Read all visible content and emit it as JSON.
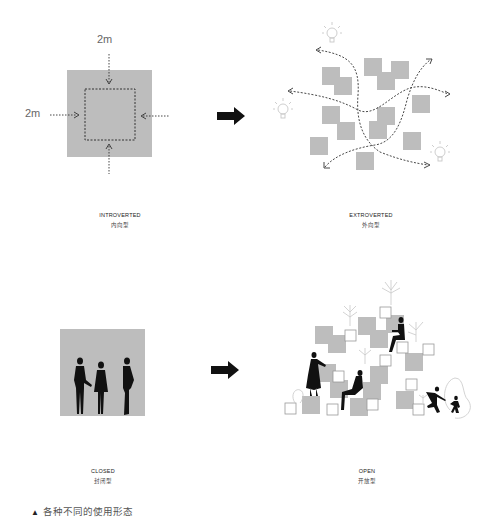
{
  "panels": [
    {
      "id": "introverted",
      "en": "INTROVERTED",
      "zh": "内向型",
      "dimension_labels": [
        "2m",
        "2m"
      ]
    },
    {
      "id": "extroverted",
      "en": "EXTROVERTED",
      "zh": "外向型"
    },
    {
      "id": "closed",
      "en": "CLOSED",
      "zh": "封闭型"
    },
    {
      "id": "open",
      "en": "OPEN",
      "zh": "开放型"
    }
  ],
  "caption": {
    "marker": "▲",
    "text": "各种不同的使用形态"
  },
  "colors": {
    "block_gray": "#bdbdbd",
    "arrow": "#111111",
    "dash": "#333333",
    "bulb": "#c8c8c8"
  },
  "icons": {
    "transition": "right-arrow-icon",
    "idea": "lightbulb-icon",
    "figure": "person-silhouette-icon",
    "plant": "plant-icon"
  }
}
